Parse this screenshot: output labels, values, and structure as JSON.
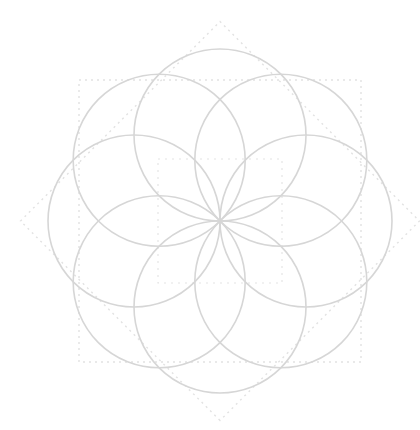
{
  "diagram": {
    "type": "flower-of-life-8",
    "canvas": {
      "width": 420,
      "height": 430,
      "background": "#ffffff"
    },
    "center": {
      "x": 220,
      "y": 221
    },
    "petal_circles": {
      "count": 8,
      "radius": 86,
      "offset": 86,
      "start_angle_deg": 0,
      "stroke": "#d6d6d6",
      "stroke_width": 1.6
    },
    "outer_outline": {
      "shape": "octagram-outline",
      "squares": 2,
      "half_size": 172,
      "rotation_deg": [
        0,
        45
      ],
      "stroke": "#e2e2e2",
      "dash": "2 4",
      "stroke_width": 1.4
    },
    "inner_square": {
      "half_size": 62,
      "stroke": "#e4e4e4",
      "dash": "2 5",
      "stroke_width": 1.2
    }
  }
}
